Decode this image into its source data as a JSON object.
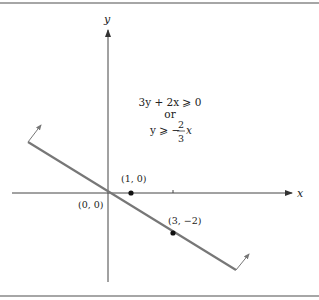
{
  "figure": {
    "axes": {
      "x_label": "x",
      "y_label": "y"
    },
    "inequality": {
      "line1": "3y + 2x ⩾ 0",
      "line2": "or",
      "line3_prefix": "y ⩾ −",
      "fraction_num": "2",
      "fraction_den": "3",
      "line3_suffix": "x"
    },
    "points": [
      {
        "label": "(0, 0)"
      },
      {
        "label": "(1, 0)"
      },
      {
        "label": "(3, −2)"
      }
    ],
    "colors": {
      "line": "#777777",
      "axis": "#333333",
      "rule": "#888888"
    }
  }
}
